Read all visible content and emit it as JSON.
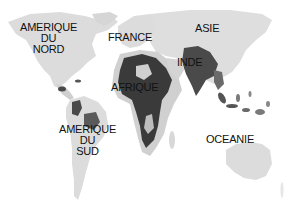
{
  "map": {
    "type": "world-map",
    "style": "grayscale",
    "colors": {
      "land_light": "#dcdcdc",
      "land_dark": "#3a3a3a",
      "land_mid": "#7a7a7a",
      "water": "#ffffff",
      "label": "#111111"
    },
    "labels": {
      "north_america": {
        "line1": "AMERIQUE",
        "line2": "DU",
        "line3": "NORD"
      },
      "france": {
        "line1": "FRANCE"
      },
      "asia": {
        "line1": "ASIE"
      },
      "india": {
        "line1": "INDE"
      },
      "africa": {
        "line1": "AFRIQUE"
      },
      "south_america": {
        "line1": "AMERIQUE",
        "line2": "DU",
        "line3": "SUD"
      },
      "oceania": {
        "line1": "OCEANIE"
      }
    }
  }
}
